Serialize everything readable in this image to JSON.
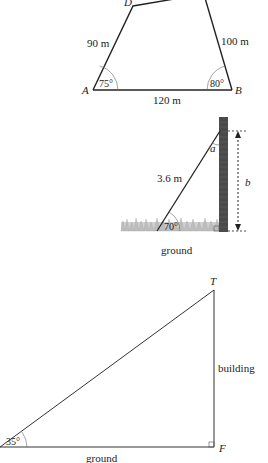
{
  "figure1": {
    "vertices": {
      "A": "A",
      "B": "B",
      "D": "D"
    },
    "sides": {
      "AD": "90 m",
      "BC": "100 m",
      "AB": "120 m"
    },
    "angles": {
      "A": "75°",
      "B": "80°"
    }
  },
  "figure2": {
    "ladder_length": "3.6 m",
    "angle_top": "a",
    "angle_ground": "70°",
    "height_label": "b",
    "ground_label": "ground"
  },
  "figure3": {
    "vertices": {
      "T": "T",
      "F": "F"
    },
    "angle": "35°",
    "vertical_label": "building",
    "ground_label": "ground"
  },
  "colors": {
    "line": "#222222",
    "wall": "#4a4a4a",
    "grass": "#b8b8b8"
  }
}
